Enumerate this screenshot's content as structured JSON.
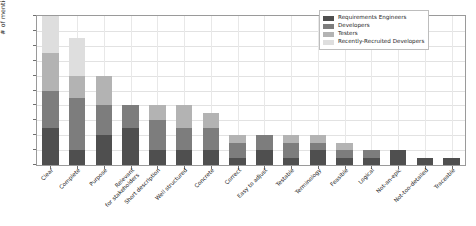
{
  "chart_data": {
    "type": "bar",
    "subtype": "stacked-vertical",
    "title": "",
    "xlabel": "",
    "ylabel": "# of mentions",
    "ylim": [
      0,
      20
    ],
    "ytick_step": 2,
    "yticks": [
      0,
      2,
      4,
      6,
      8,
      10,
      12,
      14,
      16,
      18,
      20
    ],
    "grid": true,
    "legend_position": "top-right",
    "categories": [
      "Clear",
      "Complete",
      "Purpose",
      "Relevant\nfor stakeholders",
      "Short description",
      "Well structured",
      "Concrete",
      "Correct",
      "Easy to adjust",
      "Testable",
      "Terminology",
      "Feasible",
      "Logical",
      "Not-an-epic",
      "Not-too-detailed",
      "Traceable"
    ],
    "series": [
      {
        "name": "Requirements Engineers",
        "color": "#4f4f4f",
        "values": [
          5,
          2,
          4,
          5,
          2,
          2,
          2,
          1,
          2,
          1,
          2,
          1,
          1,
          2,
          1,
          1
        ]
      },
      {
        "name": "Developers",
        "color": "#7d7d7d",
        "values": [
          5,
          7,
          4,
          3,
          4,
          3,
          3,
          2,
          2,
          2,
          1,
          1,
          1,
          0,
          0,
          0
        ]
      },
      {
        "name": "Testers",
        "color": "#b3b3b3",
        "values": [
          5,
          3,
          4,
          0,
          2,
          3,
          2,
          1,
          0,
          1,
          1,
          1,
          0,
          0,
          0,
          0
        ]
      },
      {
        "name": "Recently-Recruited Developers",
        "color": "#dedede",
        "values": [
          5,
          5,
          0,
          0,
          0,
          0,
          0,
          0,
          0,
          0,
          0,
          0,
          0,
          0,
          0,
          0
        ]
      }
    ],
    "totals": [
      20,
      17,
      12,
      8,
      8,
      8,
      7,
      4,
      4,
      4,
      4,
      3,
      2,
      2,
      1,
      1
    ]
  },
  "legend": {
    "entries": [
      "Requirements Engineers",
      "Developers",
      "Testers",
      "Recently-Recruited Developers"
    ]
  }
}
